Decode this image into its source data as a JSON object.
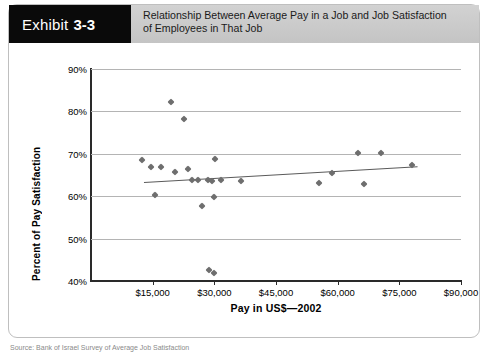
{
  "header": {
    "badge_word": "Exhibit",
    "badge_number": "3-3",
    "title_line1": "Relationship Between Average Pay in a Job and Job Satisfaction",
    "title_line2": "of  Employees in That Job"
  },
  "chart_data": {
    "type": "scatter",
    "title": "Relationship Between Average Pay in a Job and Job Satisfaction of Employees in That Job",
    "xlabel": "Pay in US$—2002",
    "ylabel": "Percent of Pay Satisfaction",
    "xlim": [
      0,
      90000
    ],
    "ylim": [
      40,
      90
    ],
    "grid": true,
    "legend": "none",
    "x_ticks": [
      15000,
      30000,
      45000,
      60000,
      75000,
      90000
    ],
    "x_tick_labels": [
      "$15,000",
      "$30,000",
      "$45,000",
      "$60,000",
      "$75,000",
      "$90,000"
    ],
    "y_ticks": [
      40,
      50,
      60,
      70,
      80,
      90
    ],
    "y_tick_labels": [
      "40%",
      "50%",
      "60%",
      "70%",
      "80%",
      "90%"
    ],
    "marker": "diamond",
    "marker_color": "#6e6e6e",
    "points": [
      {
        "x": 12500,
        "y": 68.5
      },
      {
        "x": 14500,
        "y": 67.0
      },
      {
        "x": 15500,
        "y": 60.3
      },
      {
        "x": 17000,
        "y": 66.8
      },
      {
        "x": 19500,
        "y": 82.2
      },
      {
        "x": 20500,
        "y": 65.8
      },
      {
        "x": 22500,
        "y": 78.2
      },
      {
        "x": 23500,
        "y": 66.3
      },
      {
        "x": 24500,
        "y": 63.9
      },
      {
        "x": 26000,
        "y": 63.8
      },
      {
        "x": 27000,
        "y": 57.8
      },
      {
        "x": 28500,
        "y": 63.9
      },
      {
        "x": 28800,
        "y": 42.6
      },
      {
        "x": 29400,
        "y": 63.7
      },
      {
        "x": 29800,
        "y": 41.8
      },
      {
        "x": 30000,
        "y": 59.8
      },
      {
        "x": 30200,
        "y": 68.7
      },
      {
        "x": 31500,
        "y": 63.8
      },
      {
        "x": 36500,
        "y": 63.5
      },
      {
        "x": 55500,
        "y": 63.0
      },
      {
        "x": 58500,
        "y": 65.5
      },
      {
        "x": 65000,
        "y": 70.2
      },
      {
        "x": 66500,
        "y": 62.9
      },
      {
        "x": 70500,
        "y": 70.2
      },
      {
        "x": 78000,
        "y": 67.3
      }
    ],
    "trendline": {
      "x_start": 13000,
      "y_start": 63.3,
      "x_end": 79500,
      "y_end": 67.0,
      "color": "#5a5a5a"
    }
  },
  "source_caption": "Source: Bank of Israel Survey of Average Job Satisfaction"
}
